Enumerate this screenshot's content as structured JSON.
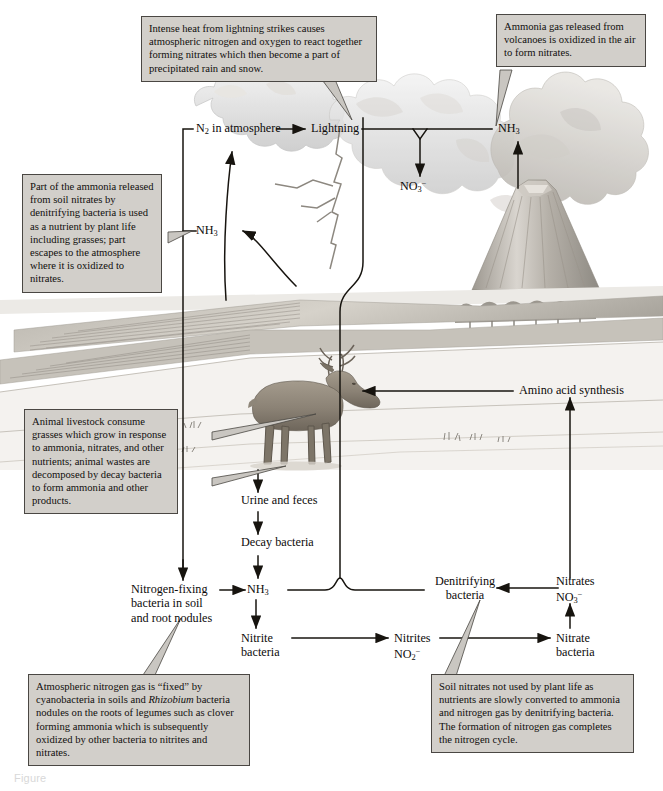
{
  "figure": {
    "title": "The nitrogen cycle",
    "caption": "Figure",
    "box_fill": "#d2cfca",
    "box_border": "#4a4743",
    "line_color": "#17140f",
    "background": "#ffffff"
  },
  "callouts": [
    {
      "id": "lightning-callout",
      "text": "Intense heat from lightning strikes causes atmospheric nitrogen and oxygen to react together forming nitrates which then become a part of precipitated rain and snow."
    },
    {
      "id": "volcano-callout",
      "text": "Ammonia gas released from volcanoes is oxidized in the air to form nitrates."
    },
    {
      "id": "ammonia-callout",
      "text": "Part of the ammonia released from soil nitrates by denitrifying bacteria is used as a nutrient by plant life including grasses; part escapes to the atmosphere where it is oxidized to nitrates."
    },
    {
      "id": "livestock-callout",
      "text": "Animal livestock consume grasses which grow in response to ammonia, nitrates, and other nutrients; animal wastes are decomposed by decay bacteria to form ammonia and other products."
    },
    {
      "id": "fixation-callout",
      "text_part1": "Atmospheric nitrogen gas is “fixed” by cyanobacteria in soils and ",
      "text_italic": "Rhizobium",
      "text_part2": " bacteria nodules on the roots of legumes such as clover forming ammonia which is subsequently oxidized by other bacteria to nitrites and nitrates."
    },
    {
      "id": "denitrification-callout",
      "text": "Soil nitrates not used by plant life as nutrients are slowly converted to ammonia and nitrogen gas by denitrifying bacteria. The formation of nitrogen gas completes the nitrogen cycle."
    }
  ],
  "nodes": {
    "n2_atmosphere": {
      "label": "N",
      "sub": "2",
      "tail": " in atmosphere"
    },
    "lightning": {
      "label": "Lightning"
    },
    "nh3_top": {
      "label": "NH",
      "sub": "3"
    },
    "no3_top": {
      "label": "NO",
      "sub": "3",
      "sup": "−"
    },
    "nh3_left": {
      "label": "NH",
      "sub": "3"
    },
    "amino_acid_synthesis": {
      "label": "Amino acid synthesis"
    },
    "urine_and_feces": {
      "label": "Urine and feces"
    },
    "decay_bacteria": {
      "label": "Decay bacteria"
    },
    "nitrogen_fixing_bacteria": {
      "line1": "Nitrogen-fixing",
      "line2": "bacteria in soil",
      "line3": "and root nodules"
    },
    "nh3_soil": {
      "label": "NH",
      "sub": "3"
    },
    "nitrite_bacteria": {
      "line1": "Nitrite",
      "line2": "bacteria"
    },
    "nitrites_no2": {
      "line1": "Nitrites",
      "label": "NO",
      "sub": "2",
      "sup": "−"
    },
    "nitrate_bacteria": {
      "line1": "Nitrate",
      "line2": "bacteria"
    },
    "nitrates_no3": {
      "line1": "Nitrates",
      "label": "NO",
      "sub": "3",
      "sup": "−"
    },
    "denitrifying_bacteria": {
      "line1": "Denitrifying",
      "line2": "bacteria"
    }
  },
  "scene": {
    "volcano": "erupting volcano with ash plume",
    "lightning_bolt": "lightning strike from storm cloud",
    "storm_cloud": "large cumulonimbus cloud",
    "deer": "grazing deer on pasture",
    "fields": "striped farm fields and hills",
    "trees": "row of trees at the horizon",
    "grass_tufts": "small grass tufts on the ground"
  }
}
